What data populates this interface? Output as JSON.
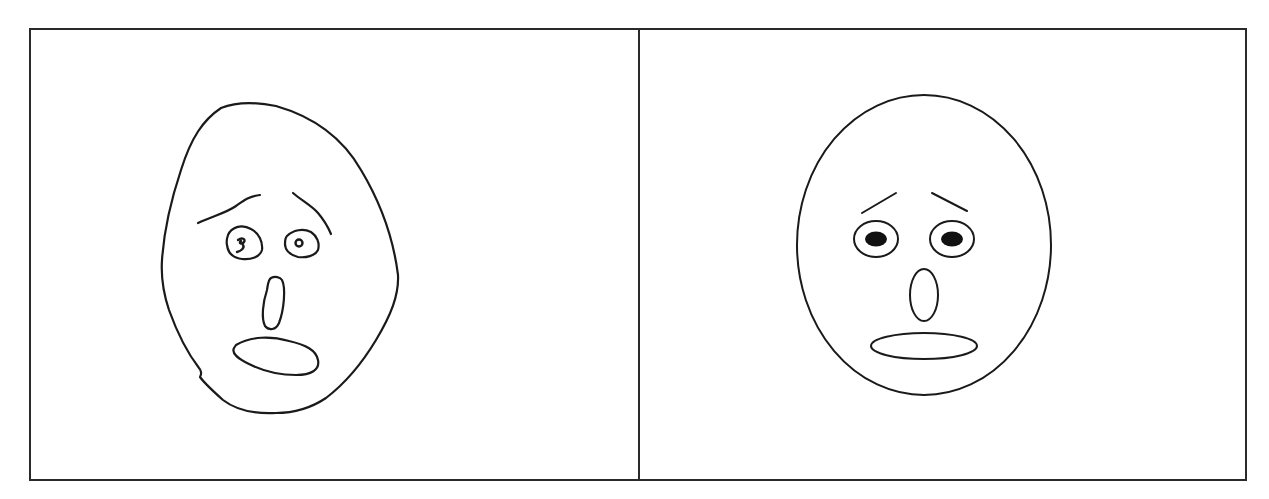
{
  "figure": {
    "panels": [
      {
        "id": "left",
        "label": "Hand-drawn face",
        "style": "freehand sketch",
        "features": [
          "irregular head outline",
          "two raised eyebrows",
          "two small round eyes with scribbled pupils",
          "oval nose",
          "open oval mouth"
        ]
      },
      {
        "id": "right",
        "label": "Schematic face",
        "style": "clean vector drawing",
        "features": [
          "oval head outline",
          "two slanted eyebrows",
          "two oval eyes with filled black pupils",
          "vertical oval nose",
          "wide horizontal oval mouth"
        ]
      }
    ],
    "colors": {
      "background": "#ffffff",
      "stroke": "#1a1a1a",
      "border": "#2a2a2a"
    }
  }
}
